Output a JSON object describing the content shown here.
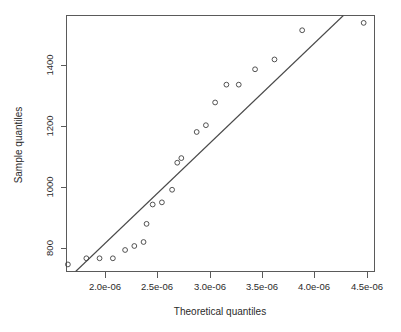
{
  "chart_data": {
    "type": "scatter",
    "title": "",
    "xlabel": "Theoretical quantiles",
    "ylabel": "Sample quantiles",
    "xlim": [
      1.72e-06,
      4.59e-06
    ],
    "ylim": [
      742,
      1575
    ],
    "grid": false,
    "legend": "none",
    "xticks": [
      2e-06,
      2.5e-06,
      3e-06,
      3.5e-06,
      4e-06,
      4.5e-06
    ],
    "xtick_labels": [
      "2.0e-06",
      "2.5e-06",
      "3.0e-06",
      "3.5e-06",
      "4.0e-06",
      "4.5e-06"
    ],
    "yticks": [
      800,
      1000,
      1200,
      1400
    ],
    "ytick_labels": [
      "800",
      "1000",
      "1200",
      "1400"
    ],
    "series": [
      {
        "name": "sample points",
        "marker": "open-circle",
        "color": "#3f3f3f",
        "x": [
          1.733e-06,
          1.905e-06,
          2.028e-06,
          2.152e-06,
          2.266e-06,
          2.352e-06,
          2.438e-06,
          2.466e-06,
          2.523e-06,
          2.609e-06,
          2.704e-06,
          2.752e-06,
          2.79e-06,
          2.933e-06,
          3.019e-06,
          3.105e-06,
          3.21e-06,
          3.325e-06,
          3.477e-06,
          3.658e-06,
          3.916e-06,
          4.489e-06
        ],
        "y": [
          765,
          785,
          785,
          785,
          812,
          825,
          838,
          897,
          960,
          967,
          1008,
          1096,
          1111,
          1196,
          1218,
          1292,
          1350,
          1350,
          1400,
          1432,
          1527,
          1551
        ]
      }
    ],
    "reference_line": {
      "name": "qq reference line",
      "color": "#4a4a4a",
      "x": [
        1.805e-06,
        4.3e-06
      ],
      "y": [
        742,
        1575
      ]
    }
  },
  "axes": {
    "x_title": "Theoretical quantiles",
    "y_title": "Sample quantiles"
  }
}
